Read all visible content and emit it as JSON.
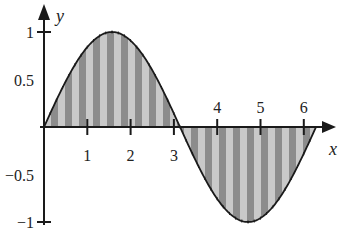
{
  "chart_data": {
    "type": "area",
    "title": "",
    "function": "y = sin(x)",
    "xlabel": "x",
    "ylabel": "y",
    "xlim": [
      0,
      6.7
    ],
    "ylim": [
      -1.1,
      1.2
    ],
    "x_ticks": [
      1,
      2,
      3,
      4,
      5,
      6
    ],
    "x_tick_labels": [
      "1",
      "2",
      "3",
      "4",
      "5",
      "6"
    ],
    "y_ticks": [
      1,
      0.5,
      -0.5,
      -1
    ],
    "y_tick_labels": [
      "1",
      "0.5",
      "−0.5",
      "−1"
    ],
    "shaded_region": {
      "from": 0,
      "to": 6.2832,
      "between": "curve and x-axis",
      "pattern": "vertical stripes"
    },
    "x": [
      0,
      0.5,
      1,
      1.5708,
      2,
      2.5,
      3,
      3.1416,
      3.5,
      4,
      4.5,
      4.7124,
      5,
      5.5,
      6,
      6.2832
    ],
    "values": [
      0,
      0.479,
      0.841,
      1,
      0.909,
      0.598,
      0.141,
      0,
      -0.351,
      -0.757,
      -0.978,
      -1,
      -0.959,
      -0.706,
      -0.279,
      0
    ],
    "grid": false,
    "legend": null
  },
  "colors": {
    "axis": "#1a1a1a",
    "curve": "#1a1a1a",
    "stripe_dark": "#8c8c8c",
    "stripe_light": "#c9c9c9"
  }
}
